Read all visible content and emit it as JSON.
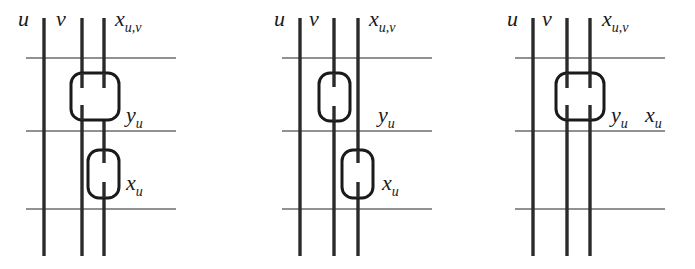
{
  "figure": {
    "title": "",
    "background_color": "#ffffff",
    "ink_color": "#1a1a1a",
    "wire_color": "#2b2b2b",
    "rail_color": "#6d6d6d",
    "box_color": "#1a1a1a",
    "width": 695,
    "height": 269
  },
  "panels": [
    {
      "id": "panel-1",
      "wire_labels": {
        "u": "u",
        "v": "v",
        "xuv": "x",
        "xuv_sub": "u,v"
      },
      "gates": [
        {
          "id": "gate-y-u",
          "label_base": "y",
          "label_sub": "u",
          "span": "wide",
          "spans_wires": "v and x_{u,v}"
        },
        {
          "id": "gate-x-u",
          "label_base": "x",
          "label_sub": "u",
          "span": "narrow",
          "spans_wires": "x_{u,v}"
        }
      ]
    },
    {
      "id": "panel-2",
      "wire_labels": {
        "u": "u",
        "v": "v",
        "xuv": "x",
        "xuv_sub": "u,v"
      },
      "gates": [
        {
          "id": "gate-y-u",
          "label_base": "y",
          "label_sub": "u",
          "span": "narrow",
          "spans_wires": "v"
        },
        {
          "id": "gate-x-u",
          "label_base": "x",
          "label_sub": "u",
          "span": "narrow",
          "spans_wires": "x_{u,v}"
        }
      ]
    },
    {
      "id": "panel-3",
      "wire_labels": {
        "u": "u",
        "v": "v",
        "xuv": "x",
        "xuv_sub": "u,v"
      },
      "gates": [
        {
          "id": "gate-y-u-x-u",
          "label_base": "y",
          "label_sub": "u",
          "label_base_2": "x",
          "label_sub_2": "u",
          "span": "wide",
          "spans_wires": "v and x_{u,v}"
        }
      ]
    }
  ]
}
